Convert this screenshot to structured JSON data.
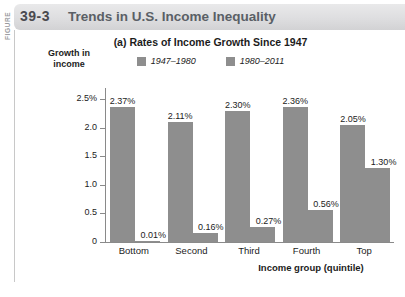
{
  "figure": {
    "word": "FIGURE",
    "number": "39-3",
    "title": "Trends in U.S. Income Inequality"
  },
  "chart_data": {
    "type": "bar",
    "title": "(a) Rates of Income Growth Since 1947",
    "xlabel": "Income group (quintile)",
    "ylabel": "Growth in income",
    "categories": [
      "Bottom",
      "Second",
      "Third",
      "Fourth",
      "Top"
    ],
    "series": [
      {
        "name": "1947–1980",
        "color": "#8e8e8e",
        "values": [
          2.37,
          2.11,
          2.3,
          2.36,
          2.05
        ],
        "labels": [
          "2.37%",
          "2.11%",
          "2.30%",
          "2.36%",
          "2.05%"
        ]
      },
      {
        "name": "1980–2011",
        "color": "#8e8e8e",
        "values": [
          0.01,
          0.16,
          0.27,
          0.56,
          1.3
        ],
        "labels": [
          "0.01%",
          "0.16%",
          "0.27%",
          "0.56%",
          "1.30%"
        ]
      }
    ],
    "ylim": [
      0,
      2.7
    ],
    "yticks": [
      0,
      0.5,
      1.0,
      1.5,
      2.0,
      2.5
    ],
    "ytick_labels": [
      "0",
      "0.5",
      "1.0",
      "1.5",
      "2.0",
      "2.5%"
    ],
    "grid": false,
    "legend_position": "top-center"
  }
}
